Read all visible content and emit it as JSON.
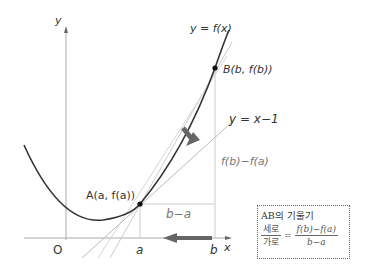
{
  "diagram": {
    "axes": {
      "x_label": "x",
      "y_label": "y",
      "origin_label": "O",
      "tick_a": "a",
      "tick_b": "b"
    },
    "curve": {
      "label": "y = f(x)",
      "color": "#333333"
    },
    "points": {
      "A": "A(a, f(a))",
      "B": "B(b, f(b))"
    },
    "tangent_line": {
      "label": "y = x−1"
    },
    "segments": {
      "horizontal": "b−a",
      "vertical": "f(b)−f(a)"
    },
    "arrows": {
      "color": "#666666"
    },
    "formula_box": {
      "title": "AB의 기울기",
      "lhs_numerator": "세로",
      "lhs_denominator": "가로",
      "equals": "=",
      "rhs_numerator": "f(b)−f(a)",
      "rhs_denominator": "b−a"
    }
  }
}
